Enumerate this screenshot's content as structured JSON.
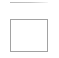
{
  "canvas": {
    "width_px": 59,
    "height_px": 58,
    "background_color": "#ffffff"
  },
  "divider": {
    "name": "top-divider",
    "label": "",
    "color": "#bdbdbd",
    "left_px": 10,
    "top_px": 2,
    "width_px": 38,
    "height_px": 1
  },
  "box": {
    "name": "empty-box",
    "label": "",
    "value": "",
    "placeholder": "",
    "border_color": "#a2a2a2",
    "fill_color": "#ffffff",
    "border_width_px": 1,
    "left_px": 10,
    "top_px": 19,
    "width_px": 38,
    "height_px": 33,
    "state": "empty"
  }
}
